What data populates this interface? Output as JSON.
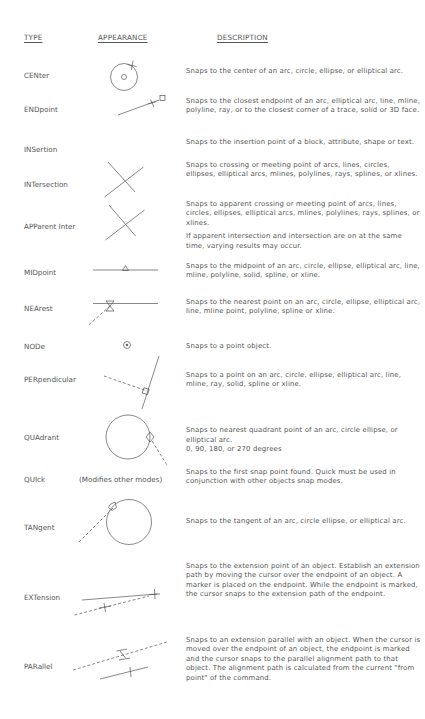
{
  "headers": {
    "type": "TYPE",
    "appearance": "APPEARANCE",
    "description": "DESCRIPTION"
  },
  "rows": [
    {
      "type": "CENter",
      "icon": "center-snap-icon",
      "description": [
        "Snaps to the center of an arc, circle, ellipse, or elliptical arc."
      ]
    },
    {
      "type": "ENDpoint",
      "icon": "endpoint-snap-icon",
      "description": [
        "Snaps to the closest endpoint of an arc, elliptical arc, line, mline, polyline, ray, or to the closest corner of  a trace, solid or 3D face."
      ]
    },
    {
      "type": "INSertion",
      "icon": "",
      "description": [
        "Snaps to the insertion point of a block, attribute, shape or text."
      ]
    },
    {
      "type": "INTersection",
      "icon": "intersection-snap-icon",
      "description": [
        "Snaps to crossing or meeting point of arcs, lines, circles, ellipses, elliptical arcs, mlines, polylines, rays, splines, or xlines."
      ]
    },
    {
      "type": "APParent Inter",
      "icon": "apparent-intersection-snap-icon",
      "description": [
        "Snaps to apparent crossing or meeting point of arcs, lines, circles, ellipses, elliptical arcs, mlines, polylines, rays, splines, or xlines.",
        "If apparent intersection and intersection are on at the same time, varying results may occur."
      ]
    },
    {
      "type": "MIDpoint",
      "icon": "midpoint-snap-icon",
      "description": [
        "Snaps to the midpoint of an arc, circle, ellipse, elliptical arc, line, mline, polyline, solid, spline, or xline."
      ]
    },
    {
      "type": "NEArest",
      "icon": "nearest-snap-icon",
      "description": [
        "Snaps to the nearest point on an arc, circle, ellipse, elliptical arc, line, mline point, polyline, spline or xline."
      ]
    },
    {
      "type": "NODe",
      "icon": "node-snap-icon",
      "description": [
        "Snaps to a point object."
      ]
    },
    {
      "type": "PERpendicular",
      "icon": "perpendicular-snap-icon",
      "description": [
        "Snaps to a point on an arc, circle, ellipse, elliptical arc, line, mline, ray, solid, spline or xline."
      ]
    },
    {
      "type": "QUAdrant",
      "icon": "quadrant-snap-icon",
      "description": [
        "Snaps to nearest quadrant point of an arc, circle ellipse, or elliptical arc.\n0, 90, 180, or 270 degrees"
      ]
    },
    {
      "type": "QUIck",
      "note": "(Modifies other modes)",
      "icon": "",
      "description": [
        "Snaps to the first snap point found.  Quick must be used in conjunction with other objects snap modes."
      ]
    },
    {
      "type": "TANgent",
      "icon": "tangent-snap-icon",
      "description": [
        "Snaps to the tangent of an arc, circle ellipse, or elliptical arc."
      ]
    },
    {
      "type": "EXTension",
      "icon": "extension-snap-icon",
      "description": [
        "Snaps to the extension point of an object. Establish an extension path by moving the cursor over the endpoint of an object. A marker is placed on the endpoint. While the endpoint is marked, the cursor snaps to the extension path of the endpoint."
      ]
    },
    {
      "type": "PARallel",
      "icon": "parallel-snap-icon",
      "description": [
        "Snaps to an extension parallel with an object. When the cursor is moved over the endpoint of an object, the endpoint is marked and the cursor snaps to the parallel alignment path to that object.  The alignment path is calculated from the current \"from point\" of the command."
      ]
    }
  ]
}
